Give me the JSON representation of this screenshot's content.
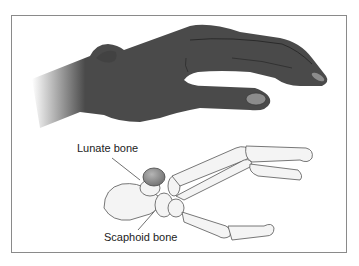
{
  "figure": {
    "labels": {
      "lunate": "Lunate bone",
      "scaphoid": "Scaphoid bone"
    },
    "colors": {
      "skin": "#4a4a4a",
      "nail": "#8c8c8c",
      "bone_fill": "#f4f4f4",
      "bone_stroke": "#555555",
      "lunate_highlight": "#8f8f8f",
      "frame": "#8a8a8a"
    }
  }
}
